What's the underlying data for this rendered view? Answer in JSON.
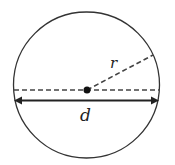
{
  "diagram": {
    "type": "circle-geometry",
    "labels": {
      "radius": "r",
      "diameter": "d"
    },
    "colors": {
      "stroke": "#333333",
      "dashed": "#444444",
      "background": "#ffffff"
    }
  }
}
